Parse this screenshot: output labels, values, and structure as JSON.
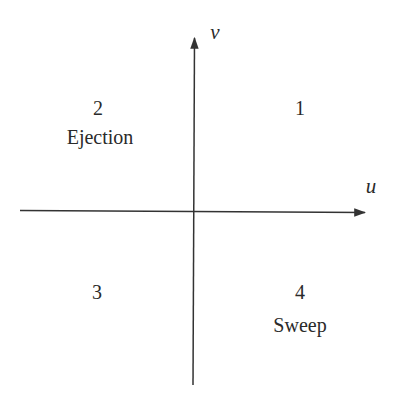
{
  "diagram": {
    "type": "quadrant",
    "axes": {
      "x_label": "u",
      "y_label": "v"
    },
    "quadrants": [
      {
        "number": "1",
        "name": ""
      },
      {
        "number": "2",
        "name": "Ejection"
      },
      {
        "number": "3",
        "name": ""
      },
      {
        "number": "4",
        "name": "Sweep"
      }
    ],
    "colors": {
      "line": "#333333",
      "text": "#2a2a2a",
      "background": "#ffffff"
    }
  }
}
